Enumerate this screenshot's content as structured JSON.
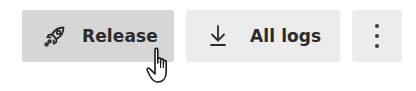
{
  "toolbar": {
    "release": {
      "label": "Release",
      "icon": "rocket-icon",
      "state": "hover"
    },
    "all_logs": {
      "label": "All logs",
      "icon": "download-icon"
    },
    "more": {
      "icon": "kebab-menu-icon"
    }
  },
  "cursor": {
    "type": "pointer-hand",
    "x": 160,
    "y": 50
  },
  "colors": {
    "button_hover_bg": "#d6d6d6",
    "button_bg": "#ececec",
    "text": "#2b2b2b",
    "page_bg": "#ffffff"
  }
}
